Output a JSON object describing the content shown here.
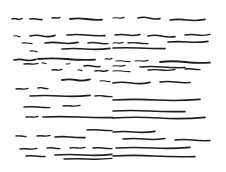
{
  "artwork": {
    "title": "",
    "description": "Abstract ink drawing of horizontal wavy brush strokes on white",
    "stroke_color": "#1e1e1e",
    "background_color": "#ffffff"
  }
}
